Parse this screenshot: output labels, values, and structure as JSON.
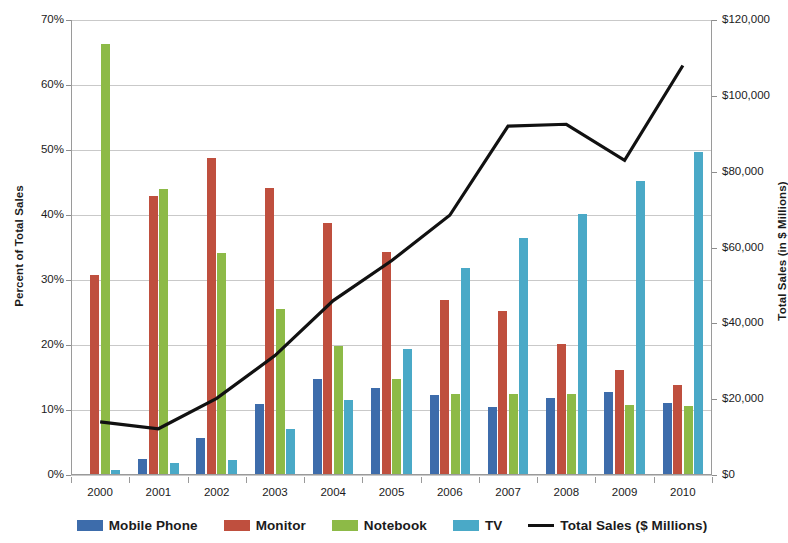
{
  "chart_data": {
    "type": "bar",
    "title": "",
    "subtitle": "",
    "xlabel": "",
    "ylabel": "Percent of Total Sales",
    "y2label": "Total Sales (in $ Millions)",
    "grid": true,
    "legend_position": "bottom",
    "categories": [
      "2000",
      "2001",
      "2002",
      "2003",
      "2004",
      "2005",
      "2006",
      "2007",
      "2008",
      "2009",
      "2010"
    ],
    "ylim": [
      0,
      70
    ],
    "ytick_labels": [
      "0%",
      "10%",
      "20%",
      "30%",
      "40%",
      "50%",
      "60%",
      "70%"
    ],
    "ytick_values": [
      0,
      10,
      20,
      30,
      40,
      50,
      60,
      70
    ],
    "y2lim": [
      0,
      120000
    ],
    "y2tick_labels": [
      "$0",
      "$20,000",
      "$40,000",
      "$60,000",
      "$80,000",
      "$100,000",
      "$120,000"
    ],
    "y2tick_values": [
      0,
      20000,
      40000,
      60000,
      80000,
      100000,
      120000
    ],
    "series": [
      {
        "name": "Mobile Phone",
        "axis": "left",
        "kind": "bar",
        "color": "#3d6cab",
        "values": [
          0.0,
          2.4,
          5.7,
          11.0,
          14.8,
          13.4,
          12.3,
          10.5,
          11.8,
          12.8,
          11.1
        ]
      },
      {
        "name": "Monitor",
        "axis": "left",
        "kind": "bar",
        "color": "#bf4f3e",
        "values": [
          30.8,
          43.0,
          48.7,
          44.2,
          38.8,
          34.3,
          26.9,
          25.3,
          20.1,
          16.1,
          13.9
        ]
      },
      {
        "name": "Notebook",
        "axis": "left",
        "kind": "bar",
        "color": "#8dba47",
        "values": [
          66.3,
          44.0,
          34.2,
          25.6,
          19.9,
          14.7,
          12.4,
          12.5,
          12.5,
          10.8,
          10.6
        ]
      },
      {
        "name": "TV",
        "axis": "left",
        "kind": "bar",
        "color": "#4aa9c7",
        "values": [
          0.8,
          1.8,
          2.3,
          7.1,
          11.5,
          19.4,
          31.9,
          36.4,
          40.1,
          45.3,
          49.7
        ]
      },
      {
        "name": "Total Sales ($ Millions)",
        "axis": "right",
        "kind": "line",
        "color": "#111111",
        "values": [
          14000,
          12200,
          20200,
          31500,
          46000,
          56500,
          68500,
          92000,
          92500,
          83000,
          108000
        ]
      }
    ],
    "legend": [
      {
        "label": "Mobile Phone",
        "marker": "square",
        "color": "#3d6cab"
      },
      {
        "label": "Monitor",
        "marker": "square",
        "color": "#bf4f3e"
      },
      {
        "label": "Notebook",
        "marker": "square",
        "color": "#8dba47"
      },
      {
        "label": "TV",
        "marker": "square",
        "color": "#4aa9c7"
      },
      {
        "label": "Total Sales ($ Millions)",
        "marker": "line",
        "color": "#111111"
      }
    ]
  }
}
